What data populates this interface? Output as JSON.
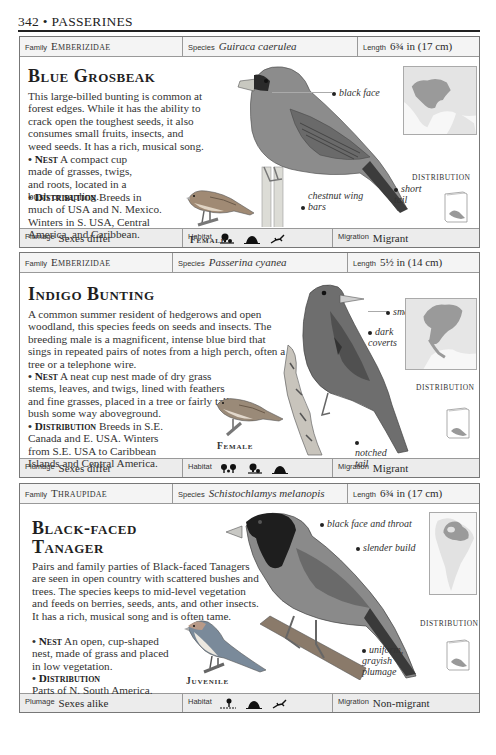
{
  "page": {
    "number": "342",
    "separator": "•",
    "section": "PASSERINES"
  },
  "labels": {
    "family": "Family",
    "species": "Species",
    "length": "Length",
    "plumage": "Plumage",
    "habitat": "Habitat",
    "migration": "Migration",
    "distribution": "DISTRIBUTION",
    "nest": "Nest",
    "distribution_heading": "Distribution",
    "bullet": "•"
  },
  "cards": [
    {
      "family": "Emberizidae",
      "species": "Guiraca caerulea",
      "length": "6¾ in (17 cm)",
      "title": "Blue Grosbeak",
      "description": "This large-billed bunting is common at forest edges. While it has the ability to crack open the toughest seeds, it also consumes small fruits, insects, and weed seeds. It has a rich, musical song.",
      "nest": "A compact cup made of grasses, twigs, and roots, located in a bush or sapling.",
      "distribution": "Breeds in much of USA and N. Mexico. Winters in S. USA, Central America, and Caribbean.",
      "inset_label": "Female",
      "callouts": [
        "black face",
        "chestnut wing bars",
        "short tail"
      ],
      "plumage": "Sexes differ",
      "habitat_icons": [
        "forest-edge-icon",
        "scrub-icon",
        "grassland-icon"
      ],
      "migration": "Migrant",
      "bird_color": "#8a8a8a"
    },
    {
      "family": "Emberizidae",
      "species": "Passerina cyanea",
      "length": "5½ in (14 cm)",
      "title": "Indigo Bunting",
      "description": "A common summer resident of hedgerows and open woodland, this species feeds on seeds and insects. The breeding male is a magnificent, intense blue bird that sings in repeated pairs of notes from a high perch, often a tree or a telephone wire.",
      "nest": "A neat cup nest made of dry grass stems, leaves, and twigs, lined with feathers and fine grasses, placed in a tree or fairly tall bush some way aboveground.",
      "distribution": "Breeds in S.E. Canada and E. USA. Winters from S.E. USA to Caribbean Islands and Central America.",
      "inset_label": "Female",
      "callouts": [
        "small bill",
        "dark coverts",
        "notched tail"
      ],
      "plumage": "Sexes differ",
      "habitat_icons": [
        "woodland-icon",
        "forest-edge-icon",
        "scrub-icon"
      ],
      "migration": "Migrant",
      "bird_color": "#6e6e6e"
    },
    {
      "family": "Thraupidae",
      "species": "Schistochlamys melanopis",
      "length": "6¾ in (17 cm)",
      "title": "Black-faced Tanager",
      "description": "Pairs and family parties of Black-faced Tanagers are seen in open country with scattered bushes and trees. The species keeps to mid-level vegetation and feeds on berries, seeds, ants, and other insects. It has a rich, musical song and is often tame.",
      "nest": "An open, cup-shaped nest, made of grass and placed in low vegetation.",
      "distribution": "Parts of N. South America.",
      "inset_label": "Juvenile",
      "callouts": [
        "black face and throat",
        "slender build",
        "uniform, grayish plumage"
      ],
      "plumage": "Sexes alike",
      "habitat_icons": [
        "scattered-tree-icon",
        "scrub-icon",
        "grassland-icon"
      ],
      "migration": "Non-migrant",
      "bird_color": "#888888"
    }
  ],
  "colors": {
    "rule": "#222222",
    "border": "#777777",
    "header_bg": "#f4f4f4",
    "footer_bg": "#ececec",
    "map_land": "#9a9a9a",
    "map_range": "#7a7a7a"
  }
}
